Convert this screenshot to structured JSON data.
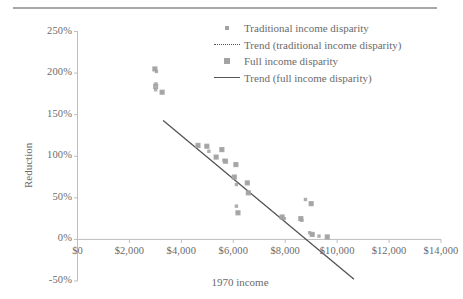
{
  "chart_data": {
    "type": "scatter",
    "title": "",
    "xlabel": "1970 income",
    "ylabel": "Reduction",
    "xlim": [
      0,
      14000
    ],
    "ylim": [
      -50,
      250
    ],
    "xticks": [
      "$0",
      "$2,000",
      "$4,000",
      "$6,000",
      "$8,000",
      "$10,000",
      "$12,000",
      "$14,000"
    ],
    "xtick_values": [
      0,
      2000,
      4000,
      6000,
      8000,
      10000,
      12000,
      14000
    ],
    "yticks": [
      "250%",
      "200%",
      "150%",
      "100%",
      "50%",
      "0%",
      "-50%"
    ],
    "ytick_values": [
      250,
      200,
      150,
      100,
      50,
      0,
      -50
    ],
    "grid": false,
    "legend_position": "top-right",
    "marker_color": "#a3a3a3",
    "trend_color": "#555555",
    "series": [
      {
        "name": "Traditional income disparity",
        "marker": "small-square",
        "points": [
          [
            2980,
            205
          ],
          [
            3040,
            202
          ],
          [
            3020,
            187
          ],
          [
            3010,
            180
          ],
          [
            3260,
            177
          ],
          [
            4640,
            113
          ],
          [
            4980,
            112
          ],
          [
            5060,
            106
          ],
          [
            5560,
            108
          ],
          [
            5340,
            99
          ],
          [
            5640,
            95
          ],
          [
            5700,
            94
          ],
          [
            6100,
            90
          ],
          [
            6040,
            75
          ],
          [
            6120,
            66
          ],
          [
            6540,
            68
          ],
          [
            6580,
            56
          ],
          [
            6120,
            40
          ],
          [
            6180,
            32
          ],
          [
            7880,
            27
          ],
          [
            7960,
            25
          ],
          [
            8600,
            25
          ],
          [
            8640,
            23
          ],
          [
            9000,
            43
          ],
          [
            8780,
            48
          ],
          [
            8940,
            8
          ],
          [
            9040,
            6
          ],
          [
            9300,
            4
          ],
          [
            9620,
            3
          ]
        ]
      },
      {
        "name": "Full income disparity",
        "marker": "large-square",
        "points": [
          [
            2980,
            205
          ],
          [
            3010,
            184
          ],
          [
            3260,
            177
          ],
          [
            4640,
            113
          ],
          [
            4980,
            112
          ],
          [
            5560,
            108
          ],
          [
            5340,
            99
          ],
          [
            5700,
            94
          ],
          [
            6100,
            90
          ],
          [
            6040,
            75
          ],
          [
            6540,
            68
          ],
          [
            6580,
            56
          ],
          [
            6180,
            32
          ],
          [
            7880,
            27
          ],
          [
            8600,
            25
          ],
          [
            9000,
            43
          ],
          [
            9040,
            6
          ],
          [
            9620,
            3
          ]
        ]
      }
    ],
    "trends": [
      {
        "name": "Trend (traditional income disparity)",
        "style": "dotted",
        "x0": 3300,
        "y0": 143,
        "x1": 10650,
        "y1": -48
      },
      {
        "name": "Trend (full income disparity)",
        "style": "solid",
        "x0": 3300,
        "y0": 143,
        "x1": 10650,
        "y1": -48
      }
    ],
    "legend": [
      {
        "label": "Traditional income disparity",
        "key": "small-square"
      },
      {
        "label": "Trend (traditional income disparity)",
        "key": "dotted-line"
      },
      {
        "label": "Full income disparity",
        "key": "large-square"
      },
      {
        "label": "Trend (full income disparity)",
        "key": "solid-line"
      }
    ]
  }
}
